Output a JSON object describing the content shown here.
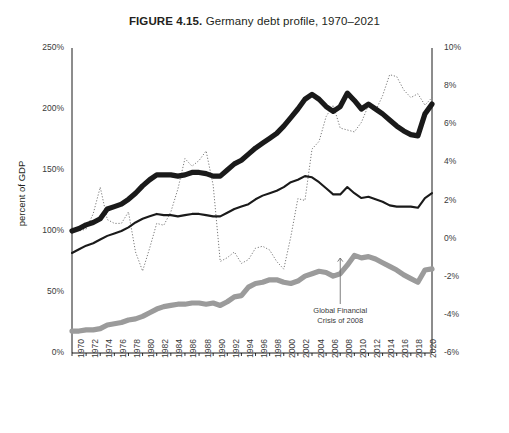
{
  "figure": {
    "fig_number": "FIGURE 4.15.",
    "title_rest": " Germany debt profile, 1970–2021"
  },
  "axes": {
    "ylabel_left": "percent of GDP",
    "left_ticks": [
      "250%",
      "200%",
      "150%",
      "100%",
      "50%",
      "0%"
    ],
    "right_ticks": [
      "10%",
      "8%",
      "6%",
      "4%",
      "2%",
      "0%",
      "-2%",
      "-4%",
      "-6%"
    ],
    "x_ticks": [
      "1970",
      "1972",
      "1974",
      "1976",
      "1978",
      "1980",
      "1982",
      "1984",
      "1986",
      "1988",
      "1990",
      "1992",
      "1994",
      "1996",
      "1998",
      "2000",
      "2002",
      "2004",
      "2006",
      "2008",
      "2010",
      "2012",
      "2014",
      "2016",
      "2018",
      "2020"
    ]
  },
  "annotation": {
    "line1": "Global Financial",
    "line2": "Crisis of 2008",
    "year": 2008
  },
  "legend": {
    "items": [
      {
        "label": "Total debt to GDP",
        "style": "thick-black",
        "color": "#1a1a1a"
      },
      {
        "label": "Private debt to GDP",
        "style": "thin-black",
        "color": "#1a1a1a"
      },
      {
        "label": "Public debt to GDP",
        "style": "thick-gray",
        "color": "#9b9b9b"
      },
      {
        "label": "Current account balance to GDP (right axis scale)",
        "style": "dotted",
        "color": "#7a7a7a"
      }
    ]
  },
  "chart_data": {
    "type": "line",
    "title": "FIGURE 4.15. Germany debt profile, 1970–2021",
    "xlabel": "",
    "ylabel": "percent of GDP",
    "ylabel_right": "percent of GDP (current account)",
    "xlim": [
      1970,
      2021
    ],
    "ylim": [
      0,
      250
    ],
    "ylim_right": [
      -6,
      10
    ],
    "grid": false,
    "legend_position": "bottom",
    "x": [
      1970,
      1971,
      1972,
      1973,
      1974,
      1975,
      1976,
      1977,
      1978,
      1979,
      1980,
      1981,
      1982,
      1983,
      1984,
      1985,
      1986,
      1987,
      1988,
      1989,
      1990,
      1991,
      1992,
      1993,
      1994,
      1995,
      1996,
      1997,
      1998,
      1999,
      2000,
      2001,
      2002,
      2003,
      2004,
      2005,
      2006,
      2007,
      2008,
      2009,
      2010,
      2011,
      2012,
      2013,
      2014,
      2015,
      2016,
      2017,
      2018,
      2019,
      2020,
      2021
    ],
    "series": [
      {
        "name": "Total debt to GDP",
        "axis": "left",
        "style": "thick-black",
        "color": "#1a1a1a",
        "values": [
          100,
          102,
          105,
          107,
          110,
          118,
          120,
          122,
          126,
          131,
          137,
          142,
          146,
          146,
          146,
          145,
          146,
          148,
          148,
          147,
          145,
          145,
          150,
          155,
          158,
          163,
          168,
          172,
          176,
          180,
          186,
          193,
          200,
          208,
          212,
          208,
          202,
          198,
          202,
          213,
          207,
          200,
          204,
          200,
          196,
          191,
          186,
          182,
          179,
          178,
          196,
          204
        ]
      },
      {
        "name": "Private debt to GDP",
        "axis": "left",
        "style": "thin-black",
        "color": "#1a1a1a",
        "values": [
          82,
          85,
          88,
          90,
          93,
          96,
          98,
          100,
          103,
          107,
          110,
          112,
          114,
          113,
          113,
          112,
          113,
          114,
          114,
          113,
          112,
          112,
          115,
          118,
          120,
          122,
          126,
          129,
          131,
          133,
          136,
          140,
          142,
          145,
          144,
          140,
          135,
          130,
          130,
          136,
          131,
          127,
          128,
          126,
          124,
          121,
          120,
          120,
          120,
          119,
          127,
          131
        ]
      },
      {
        "name": "Public debt to GDP",
        "axis": "left",
        "style": "thick-gray",
        "color": "#9b9b9b",
        "values": [
          18,
          18,
          19,
          19,
          20,
          23,
          24,
          25,
          27,
          28,
          30,
          33,
          36,
          38,
          39,
          40,
          40,
          41,
          41,
          40,
          41,
          39,
          42,
          46,
          47,
          54,
          57,
          58,
          60,
          60,
          58,
          57,
          59,
          63,
          65,
          67,
          66,
          63,
          65,
          72,
          80,
          78,
          79,
          77,
          74,
          71,
          68,
          64,
          61,
          58,
          68,
          69
        ]
      },
      {
        "name": "Current account balance to GDP (right axis scale)",
        "axis": "right",
        "style": "dotted",
        "color": "#7a7a7a",
        "values": [
          0.6,
          0.4,
          0.5,
          1.3,
          2.7,
          1.0,
          0.8,
          0.8,
          1.4,
          -0.7,
          -1.7,
          -0.5,
          0.8,
          0.7,
          1.4,
          2.6,
          4.2,
          3.8,
          4.1,
          4.6,
          2.8,
          -1.2,
          -1.0,
          -0.7,
          -1.3,
          -1.1,
          -0.5,
          -0.4,
          -0.6,
          -1.2,
          -1.6,
          0.1,
          2.1,
          2.0,
          4.7,
          5.1,
          6.4,
          7.0,
          5.8,
          5.7,
          5.6,
          6.1,
          7.0,
          6.7,
          7.5,
          8.6,
          8.5,
          7.8,
          7.4,
          7.6,
          7.0,
          7.4
        ]
      }
    ]
  }
}
